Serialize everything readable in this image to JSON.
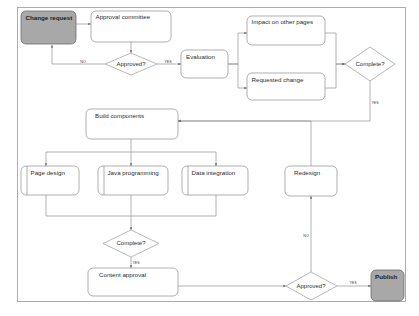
{
  "diagram": {
    "colors": {
      "node_fill": "#ffffff",
      "node_stroke": "#8c8c8c",
      "terminal_fill": "#a8a8a8",
      "terminal_stroke": "#6d6d6d",
      "edge": "#8a8a8a",
      "frame": "#9a9a9a",
      "text": "#2c2c2c"
    },
    "nodes": {
      "change_request": "Change request",
      "approval_committee": "Approval committee",
      "approved_1": "Approved?",
      "evaluation": "Evaluation",
      "impact_other_pages": "Impact on other pages",
      "requested_change": "Requested change",
      "complete_1": "Complete?",
      "build_components": "Build components",
      "page_design": "Page design",
      "java_programming": "Java programming",
      "data_integration": "Data integration",
      "redesign": "Redesign",
      "complete_2": "Complete?",
      "content_approval": "Content approval",
      "approved_2": "Approved?",
      "publish": "Publish"
    },
    "edge_labels": {
      "approved1_no": "NO",
      "approved1_yes": "YES",
      "complete1_yes": "YES",
      "complete2_yes": "YES",
      "approved2_no": "NO",
      "approved2_yes": "YES"
    }
  }
}
